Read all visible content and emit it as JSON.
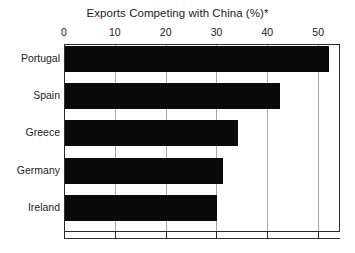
{
  "chart_data": {
    "type": "bar",
    "orientation": "horizontal",
    "title": "Exports Competing with China (%)*",
    "xlabel": "",
    "ylabel": "",
    "categories": [
      "Portugal",
      "Spain",
      "Greece",
      "Germany",
      "Ireland"
    ],
    "values": [
      52,
      42.3,
      34,
      31,
      30
    ],
    "xlim": [
      0,
      54.3
    ],
    "xticks": [
      0,
      10,
      20,
      30,
      40,
      50
    ],
    "xtick_labels": [
      "0",
      "10",
      "20",
      "30",
      "40",
      "50"
    ],
    "grid": "vertical",
    "legend": "none",
    "bar_color": "#0a0a0a",
    "gridline_color": "#a8a8a8",
    "axis_color": "#2b2b2b",
    "background_color": "#ffffff"
  }
}
